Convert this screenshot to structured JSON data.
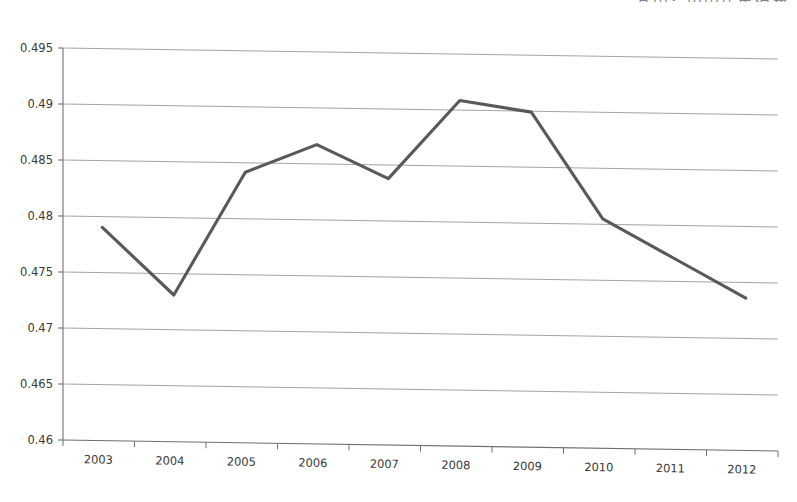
{
  "chart_data": {
    "type": "line",
    "title": "",
    "partial_top_right_text": "其中：中国居民消费",
    "xlabel": "",
    "ylabel": "",
    "categories": [
      "2003",
      "2004",
      "2005",
      "2006",
      "2007",
      "2008",
      "2009",
      "2010",
      "2011",
      "2012"
    ],
    "values": [
      0.479,
      0.473,
      0.484,
      0.4865,
      0.4835,
      0.4905,
      0.4895,
      0.48,
      0.4765,
      0.473
    ],
    "series": [
      {
        "name": "series-1",
        "values": [
          0.479,
          0.473,
          0.484,
          0.4865,
          0.4835,
          0.4905,
          0.4895,
          0.48,
          0.4765,
          0.473
        ]
      }
    ],
    "ylim": [
      0.46,
      0.495
    ],
    "yticks": [
      "0.46",
      "0.465",
      "0.47",
      "0.475",
      "0.48",
      "0.485",
      "0.49",
      "0.495"
    ],
    "ytick_values": [
      0.46,
      0.465,
      0.47,
      0.475,
      0.48,
      0.485,
      0.49,
      0.495
    ],
    "xticks": [
      "2003",
      "2004",
      "2005",
      "2006",
      "2007",
      "2008",
      "2009",
      "2010",
      "2011",
      "2012"
    ],
    "grid": true,
    "legend": "none",
    "line_color": "#595959",
    "grid_color": "#9a9a9a",
    "axis_color": "#6f6f6f",
    "background_color": "#ffffff"
  }
}
